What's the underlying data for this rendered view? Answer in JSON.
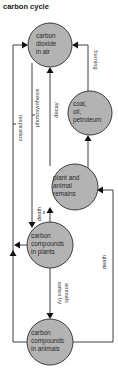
{
  "title": "carbon cycle",
  "colors": {
    "node_fill": "#b3b3b3",
    "node_stroke": "#3a3a3a",
    "line": "#2a2a2a",
    "background": "#ffffff"
  },
  "nodes": [
    {
      "id": "air",
      "lines": [
        "carbon",
        "dioxide",
        "in air"
      ]
    },
    {
      "id": "fossil",
      "lines": [
        "coal,",
        "oil,",
        "petroleum"
      ]
    },
    {
      "id": "remains",
      "lines": [
        "plant and",
        "animal",
        "remains"
      ]
    },
    {
      "id": "plants",
      "lines": [
        "carbon",
        "compounds",
        "in plants"
      ]
    },
    {
      "id": "animals",
      "lines": [
        "carbon",
        "compounds",
        "in animals"
      ]
    }
  ],
  "edges": [
    {
      "label": "respiration",
      "from": "plants/animals",
      "to": "air"
    },
    {
      "label": "photosynthesis",
      "from": "air",
      "to": "plants"
    },
    {
      "label": "decay",
      "from": "remains",
      "to": "air"
    },
    {
      "label": "burning",
      "from": "fossil",
      "to": "air"
    },
    {
      "label": "death",
      "from": "plants",
      "to": "remains"
    },
    {
      "label": "death",
      "from": "animals",
      "to": "remains"
    },
    {
      "label": "eaten by animals",
      "label_lines": [
        "eaten by",
        "animals"
      ],
      "from": "plants",
      "to": "animals"
    }
  ]
}
